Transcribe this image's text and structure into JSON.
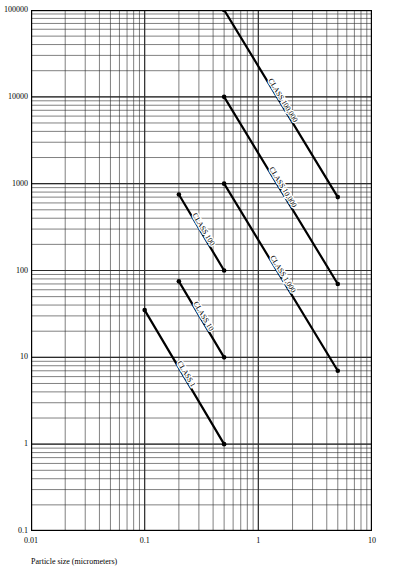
{
  "chart_data": {
    "type": "line",
    "title": "",
    "xlabel": "Particle size (micrometers)",
    "ylabel": "",
    "xscale": "log",
    "yscale": "log",
    "xlim": [
      0.01,
      10
    ],
    "ylim": [
      0.1,
      100000
    ],
    "grid": "log-log minor grid on both axes",
    "legend": "inline rotated labels along each line",
    "xticks": [
      "0.01",
      "0.1",
      "1",
      "10"
    ],
    "yticks": [
      "0.1",
      "1",
      "10",
      "100",
      "1000",
      "10000",
      "100000"
    ],
    "series": [
      {
        "name": "CLASS 100,000",
        "label": "CLASS 100,000",
        "points": [
          {
            "x": 0.5,
            "y": 100000
          },
          {
            "x": 5,
            "y": 700
          }
        ]
      },
      {
        "name": "CLASS 10,000",
        "label": "CLASS 10,000",
        "points": [
          {
            "x": 0.5,
            "y": 10000
          },
          {
            "x": 5,
            "y": 70
          }
        ]
      },
      {
        "name": "CLASS 1,000",
        "label": "CLASS 1,000",
        "points": [
          {
            "x": 0.5,
            "y": 1000
          },
          {
            "x": 5,
            "y": 7
          }
        ]
      },
      {
        "name": "CLASS 100",
        "label": "CLASS 100",
        "points": [
          {
            "x": 0.2,
            "y": 750
          },
          {
            "x": 0.5,
            "y": 100
          }
        ]
      },
      {
        "name": "CLASS 10",
        "label": "CLASS 10",
        "points": [
          {
            "x": 0.2,
            "y": 75
          },
          {
            "x": 0.5,
            "y": 10
          }
        ]
      },
      {
        "name": "CLASS 1",
        "label": "CLASS 1",
        "points": [
          {
            "x": 0.1,
            "y": 35
          },
          {
            "x": 0.5,
            "y": 1
          }
        ]
      }
    ]
  },
  "axes": {
    "x_title": "Particle size (micrometers)",
    "x_tick_labels": [
      "0.01",
      "0.1",
      "1",
      "10"
    ],
    "y_tick_labels": [
      "100000",
      "10000",
      "1000",
      "100",
      "10",
      "1",
      "0.1"
    ]
  },
  "style": {
    "line_color": "#000000",
    "grid_color": "#333333",
    "background": "#ffffff"
  }
}
